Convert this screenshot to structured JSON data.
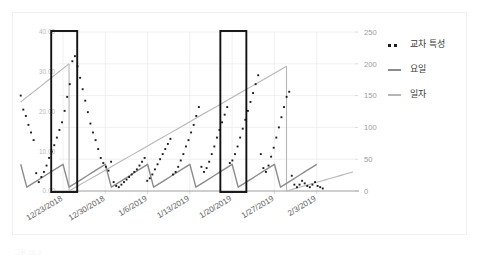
{
  "chart_data": {
    "type": "line",
    "title": "",
    "xlabel": "",
    "ylabel": "",
    "grid": true,
    "legend_position": "right",
    "x_tick_labels": [
      "12/23/2018",
      "12/30/2018",
      "1/6/2019",
      "1/13/2019",
      "1/20/2019",
      "1/27/2019",
      "2/3/2019"
    ],
    "left_axis": {
      "tick_labels": [
        "0.00",
        "10.00",
        "20.00",
        "30.00",
        "40.00"
      ],
      "ylim": [
        0,
        40
      ],
      "step": 10
    },
    "right_axis": {
      "tick_labels": [
        "0",
        "50",
        "100",
        "150",
        "200",
        "250"
      ],
      "ylim": [
        0,
        250
      ],
      "step": 50
    },
    "series": [
      {
        "name": "교차 특성",
        "style": "dotted",
        "color": "#1d1d1d",
        "axis": "right",
        "values": [
          150,
          128,
          118,
          104,
          92,
          80,
          28,
          14,
          22,
          30,
          40,
          52,
          62,
          72,
          84,
          96,
          108,
          126,
          148,
          168,
          204,
          212,
          196,
          178,
          160,
          142,
          124,
          106,
          92,
          80,
          66,
          52,
          44,
          38,
          32,
          46,
          14,
          8,
          6,
          10,
          14,
          18,
          22,
          26,
          30,
          34,
          40,
          46,
          52,
          16,
          20,
          26,
          34,
          42,
          50,
          58,
          66,
          74,
          82,
          26,
          30,
          38,
          48,
          58,
          70,
          80,
          92,
          104,
          118,
          132,
          38,
          30,
          36,
          46,
          58,
          70,
          84,
          96,
          108,
          120,
          132,
          44,
          48,
          58,
          70,
          84,
          98,
          112,
          126,
          140,
          154,
          168,
          182,
          58,
          36,
          30,
          40,
          54,
          68,
          84,
          100,
          116,
          132,
          148,
          156,
          24,
          10,
          6,
          10,
          16,
          12,
          8,
          6,
          10,
          14,
          8,
          6,
          4
        ]
      },
      {
        "name": "요일",
        "style": "solid",
        "color": "#8c8c8c",
        "axis": "right",
        "description": "weekly sawtooth, resets every 7 days",
        "values": [
          42,
          6,
          12,
          18,
          24,
          30,
          36,
          42,
          6,
          12,
          18,
          24,
          30,
          36,
          42,
          6,
          12,
          18,
          24,
          30,
          36,
          42,
          6,
          12,
          18,
          24,
          30,
          36,
          42,
          6,
          12,
          18,
          24,
          30,
          36,
          42,
          6,
          12,
          18,
          24,
          30,
          36,
          42,
          6,
          12,
          18,
          24,
          30,
          36,
          42
        ]
      },
      {
        "name": "일자",
        "style": "solid",
        "color": "#b6b6b6",
        "axis": "right",
        "description": "day-of-month counter ramps that reset at month boundary",
        "segments": [
          {
            "start_index": 0,
            "values": [
              140,
              200
            ]
          },
          {
            "start_index": 8,
            "values": [
              0,
              196
            ]
          },
          {
            "start_index": 44,
            "values": [
              0,
              30
            ]
          }
        ]
      }
    ],
    "annotations": [
      {
        "type": "highlight-rect",
        "label": "highlight-box-1",
        "x_center": "12/30/2018",
        "color": "#111111"
      },
      {
        "type": "highlight-rect",
        "label": "highlight-box-2",
        "x_center": "1/27/2019",
        "color": "#111111"
      }
    ]
  },
  "legend": {
    "entries": [
      {
        "label": "교차 특성",
        "key": "dotted-key"
      },
      {
        "label": "요일",
        "key": "dark-dash-key"
      },
      {
        "label": "일자",
        "key": "light-dash-key"
      }
    ]
  },
  "caption": {
    "text": "그림 10-1"
  }
}
